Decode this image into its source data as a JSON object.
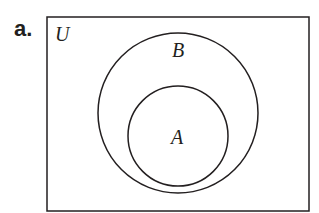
{
  "figure": {
    "part_label": "a.",
    "universe_label": "U",
    "outer_set_label": "B",
    "inner_set_label": "A",
    "stroke_color": "#231f20",
    "background": "#ffffff"
  }
}
